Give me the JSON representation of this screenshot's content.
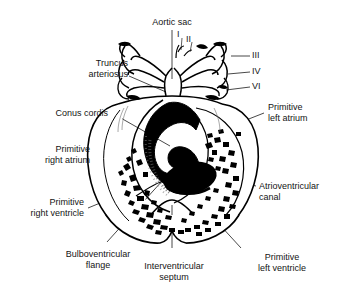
{
  "figure": {
    "title": "Aortic sac",
    "ink_color": "#000000",
    "text_color": "#141414",
    "background": "#ffffff"
  },
  "labels": {
    "aortic_sac": "Aortic sac",
    "truncus_arteriosus": "Truncus\narteriosus",
    "truncus_line1": "Truncus",
    "truncus_line2": "arteriosus",
    "conus_cordis": "Conus cordis",
    "primitive_right_atrium_line1": "Primitive",
    "primitive_right_atrium_line2": "right atrium",
    "primitive_right_ventricle_line1": "Primitive",
    "primitive_right_ventricle_line2": "right ventricle",
    "primitive_left_atrium_line1": "Primitive",
    "primitive_left_atrium_line2": "left atrium",
    "atrioventricular_canal_line1": "Atrioventricular",
    "atrioventricular_canal_line2": "canal",
    "primitive_left_ventricle_line1": "Primitive",
    "primitive_left_ventricle_line2": "left ventricle",
    "bulboventricular_flange_line1": "Bulboventricular",
    "bulboventricular_flange_line2": "flange",
    "interventricular_septum_line1": "Interventricular",
    "interventricular_septum_line2": "septum"
  },
  "arch_numerals": {
    "arch_1": "I",
    "arch_2": "II",
    "arch_3": "III",
    "arch_4": "IV",
    "arch_6": "VI"
  }
}
